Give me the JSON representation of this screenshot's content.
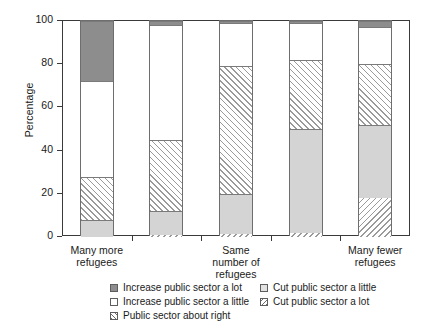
{
  "chart_data": {
    "type": "bar",
    "title": "",
    "subtitle": "",
    "xlabel": "",
    "ylabel": "Percentage",
    "ylim": [
      0,
      100
    ],
    "yticks": [
      0,
      20,
      40,
      60,
      80,
      100
    ],
    "grid": false,
    "stacked": true,
    "legend_position": "bottom",
    "categories": [
      "Many more refugees",
      "",
      "Same number of refugees",
      "",
      "Many fewer refugees"
    ],
    "category_tick_labels": [
      "Many more\nrefugees",
      "",
      "Same\nnumber of\nrefugees",
      "",
      "Many fewer\nrefugees"
    ],
    "series": [
      {
        "name": "Cut public sector a lot",
        "swatch": "hatch-left",
        "values": [
          0,
          1,
          1.5,
          2,
          18
        ]
      },
      {
        "name": "Cut public sector a little",
        "swatch": "solid-light",
        "values": [
          8,
          11,
          18.5,
          48,
          34
        ]
      },
      {
        "name": "Public sector about right",
        "swatch": "hatch-right",
        "values": [
          20,
          33,
          59,
          32,
          28
        ]
      },
      {
        "name": "Increase public sector a little",
        "swatch": "white",
        "values": [
          44,
          53,
          20,
          17,
          17
        ]
      },
      {
        "name": "Increase public sector a lot",
        "swatch": "solid-dark",
        "values": [
          28,
          2,
          1,
          1,
          3
        ]
      }
    ],
    "cumulative_tops": [
      [
        8,
        28,
        72,
        100
      ],
      [
        1,
        12,
        45,
        98,
        100
      ],
      [
        1.5,
        20,
        79,
        99,
        100
      ],
      [
        2,
        50,
        82,
        99,
        100
      ],
      [
        18,
        52,
        80,
        97,
        100
      ]
    ]
  },
  "legend": {
    "entries": [
      {
        "label": "Increase public sector a lot",
        "swatch": "solid-dark"
      },
      {
        "label": "Cut public sector a little",
        "swatch": "solid-light"
      },
      {
        "label": "Increase public sector a little",
        "swatch": "white"
      },
      {
        "label": "Cut public sector a lot",
        "swatch": "hatch-left"
      },
      {
        "label": "Public sector about right",
        "swatch": "hatch-right"
      }
    ]
  },
  "colors": {
    "solid_dark": "#8d8d8d",
    "solid_light": "#d4d4d4",
    "white": "#ffffff",
    "hatch_line": "#9a9a9a",
    "axis": "#3a3a3a",
    "bar_border": "#6e6e6e"
  }
}
